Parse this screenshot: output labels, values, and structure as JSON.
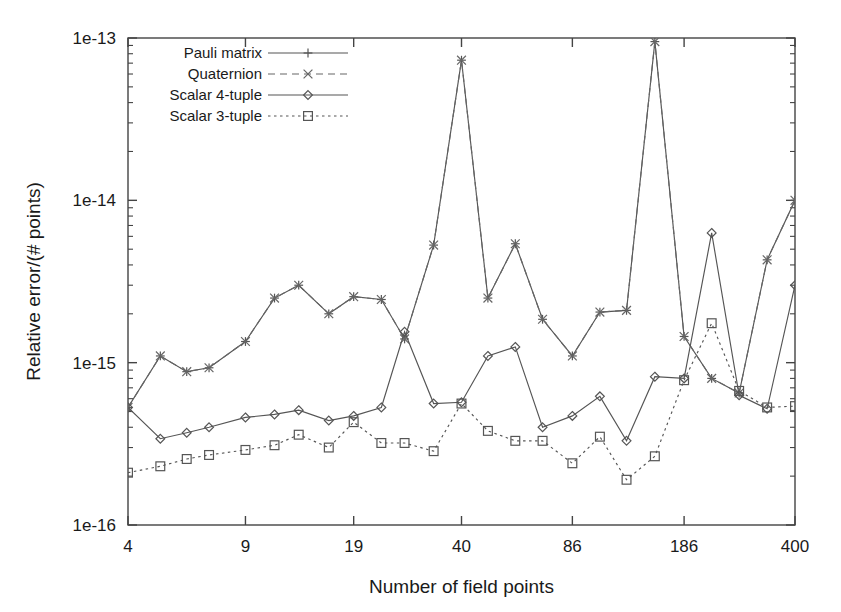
{
  "chart_data": {
    "type": "line",
    "title": "",
    "xlabel": "Number of field points",
    "ylabel": "Relative error/(# points)",
    "xscale": "log",
    "yscale": "log",
    "xlim": [
      4,
      400
    ],
    "ylim": [
      1e-16,
      1e-13
    ],
    "xtick_labels": [
      "4",
      "9",
      "19",
      "40",
      "86",
      "186",
      "400"
    ],
    "xtick_values": [
      4,
      9,
      19,
      40,
      86,
      186,
      400
    ],
    "ytick_labels": [
      "1e-16",
      "1e-15",
      "1e-14",
      "1e-13"
    ],
    "ytick_values": [
      1e-16,
      1e-15,
      1e-14,
      1e-13
    ],
    "grid": false,
    "legend_position": "top-left-inside",
    "x": [
      4,
      5,
      6,
      7,
      9,
      11,
      13,
      16,
      19,
      23,
      27,
      33,
      40,
      48,
      58,
      70,
      86,
      104,
      125,
      152,
      186,
      225,
      272,
      330,
      400
    ],
    "series": [
      {
        "name": "Pauli matrix",
        "marker": "plus",
        "linestyle": "solid",
        "color": "#555555",
        "values": [
          5.3e-16,
          1.1e-15,
          8.8e-16,
          9.3e-16,
          1.35e-15,
          2.5e-15,
          3e-15,
          2e-15,
          2.55e-15,
          2.45e-15,
          1.4e-15,
          5.3e-15,
          7.3e-14,
          2.5e-15,
          5.4e-15,
          1.85e-15,
          1.1e-15,
          2.05e-15,
          2.1e-15,
          9.5e-14,
          1.45e-15,
          8e-16,
          6.5e-16,
          4.3e-15,
          1e-14
        ]
      },
      {
        "name": "Quaternion",
        "marker": "cross",
        "linestyle": "dashed",
        "color": "#666666",
        "values": [
          5.3e-16,
          1.1e-15,
          8.8e-16,
          9.3e-16,
          1.35e-15,
          2.5e-15,
          3e-15,
          2e-15,
          2.55e-15,
          2.45e-15,
          1.4e-15,
          5.3e-15,
          7.3e-14,
          2.5e-15,
          5.4e-15,
          1.85e-15,
          1.1e-15,
          2.05e-15,
          2.1e-15,
          9.5e-14,
          1.45e-15,
          8e-16,
          6.5e-16,
          4.3e-15,
          1e-14
        ]
      },
      {
        "name": "Scalar 4-tuple",
        "marker": "diamond",
        "linestyle": "solid",
        "color": "#555555",
        "values": [
          5.3e-16,
          3.4e-16,
          3.7e-16,
          4e-16,
          4.6e-16,
          4.8e-16,
          5.1e-16,
          4.4e-16,
          4.7e-16,
          5.3e-16,
          1.55e-15,
          5.6e-16,
          5.7e-16,
          1.1e-15,
          1.25e-15,
          4e-16,
          4.7e-16,
          6.2e-16,
          3.3e-16,
          8.2e-16,
          8e-16,
          6.3e-15,
          6.3e-16,
          5.2e-16,
          3e-15
        ]
      },
      {
        "name": "Scalar 3-tuple",
        "marker": "square",
        "linestyle": "dotted",
        "color": "#555555",
        "values": [
          2.1e-16,
          2.3e-16,
          2.55e-16,
          2.7e-16,
          2.9e-16,
          3.1e-16,
          3.6e-16,
          3e-16,
          4.3e-16,
          3.2e-16,
          3.2e-16,
          2.85e-16,
          5.6e-16,
          3.8e-16,
          3.3e-16,
          3.3e-16,
          2.4e-16,
          3.5e-16,
          1.9e-16,
          2.65e-16,
          7.8e-16,
          1.75e-15,
          6.7e-16,
          5.3e-16,
          5.4e-16
        ]
      }
    ]
  },
  "legend": {
    "entries": [
      {
        "label": "Pauli matrix"
      },
      {
        "label": "Quaternion"
      },
      {
        "label": "Scalar 4-tuple"
      },
      {
        "label": "Scalar 3-tuple"
      }
    ]
  },
  "style": {
    "axis_color": "#444444",
    "text_color": "#1a1a1a",
    "background": "#ffffff"
  }
}
